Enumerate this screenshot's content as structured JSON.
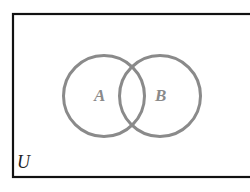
{
  "diagram": {
    "type": "venn",
    "universe": {
      "label": "U",
      "border_color": "#111111"
    },
    "sets": [
      {
        "id": "A",
        "label": "A",
        "stroke_color": "#8a8a8a"
      },
      {
        "id": "B",
        "label": "B",
        "stroke_color": "#8a8a8a"
      }
    ]
  }
}
